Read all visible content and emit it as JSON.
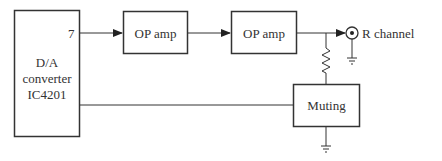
{
  "diagram": {
    "blocks": {
      "dac": {
        "line1": "D/A",
        "line2": "converter",
        "line3": "IC4201",
        "pin": "7"
      },
      "opamp1": {
        "label": "OP amp"
      },
      "opamp2": {
        "label": "OP amp"
      },
      "muting": {
        "label": "Muting"
      }
    },
    "output": {
      "label": "R channel"
    },
    "colors": {
      "stroke": "#333333",
      "background": "#ffffff"
    }
  }
}
